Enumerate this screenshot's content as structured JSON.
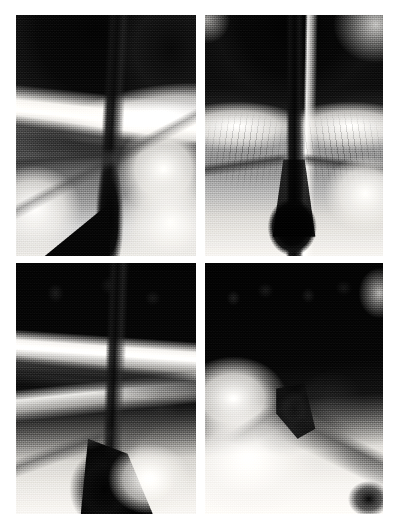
{
  "figure": {
    "kind": "radiograph-panel-grid",
    "background_color": "#ffffff",
    "width": 399,
    "height": 531,
    "columns": 2,
    "rows": 2,
    "gutter_x_px": 8,
    "gutter_y_px": 7,
    "modality": "fluoroscopic barium contrast radiograph",
    "color_mode": "grayscale",
    "caption": "",
    "panel_labels": [],
    "palette": {
      "film_black": "#0d0d0d",
      "dark_gray": "#2e2e2e",
      "mid_gray": "#7a7a7a",
      "light_gray": "#c9c9c9",
      "barium_white": "#f2f0ec",
      "page_white": "#ffffff"
    },
    "panels": [
      {
        "id": "panel-top-left",
        "position": "top-left",
        "x": 16,
        "y": 15,
        "w": 180,
        "h": 241,
        "label": "",
        "description": "Lateral barium swallow: dense dark soft-tissue mass superiorly, bright barium-coated mucosal band crossing obliquely, vertical dark column descending through mid-field with crossing fold lines, bright lobulated structure lower right."
      },
      {
        "id": "panel-top-right",
        "position": "top-right",
        "x": 205,
        "y": 15,
        "w": 178,
        "h": 241,
        "label": "",
        "description": "Frontal view: large dark dome-shaped density above, narrow dark vertical channel descending to a bulbous dark collection at the base, symmetric bright striated mucosal wings flanking the channel."
      },
      {
        "id": "panel-bottom-left",
        "position": "bottom-left",
        "x": 16,
        "y": 263,
        "w": 180,
        "h": 251,
        "label": "",
        "description": "Oblique projection: broad dark band across the top, bright horizontal barium stripe mid-field, dark vertical column descending to a large wedge-shaped dark collection at the bottom with bright flared structure to the right."
      },
      {
        "id": "panel-bottom-right",
        "position": "bottom-right",
        "x": 205,
        "y": 263,
        "w": 178,
        "h": 251,
        "label": "",
        "description": "Oblique projection: dense dark region upper field with a mottled texture, bright barium pooled lower left, dark narrowed segment crossing obliquely to the lower right with a curved dark tail."
      }
    ]
  }
}
